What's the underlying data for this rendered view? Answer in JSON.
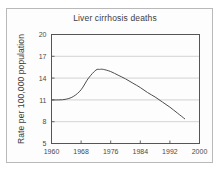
{
  "figure": {
    "title": "Liver cirrhosis deaths",
    "background_color": "#fdfdfd",
    "border_color": "#b9b9b9"
  },
  "chart_data": {
    "type": "line",
    "title": "Liver cirrhosis deaths",
    "xlabel": "",
    "ylabel": "Rate per 100,000 population",
    "xlim": [
      1960,
      2000
    ],
    "ylim": [
      5,
      20
    ],
    "xticks": [
      1960,
      1968,
      1976,
      1984,
      1992,
      2000
    ],
    "xticklabels": [
      "1960",
      "1968",
      "1976",
      "1984",
      "1992",
      "2000"
    ],
    "yticks": [
      5,
      8,
      11,
      14,
      17,
      20
    ],
    "yticklabels": [
      "5",
      "8",
      "11",
      "14",
      "17",
      "20"
    ],
    "grid": true,
    "grid_axis": "y",
    "legend": false,
    "line_color": "#4d4d4d",
    "line_width": 1,
    "series": [
      {
        "name": "Liver cirrhosis death rate",
        "x": [
          1960,
          1962,
          1964,
          1966,
          1968,
          1970,
          1972,
          1973,
          1974,
          1976,
          1978,
          1980,
          1982,
          1984,
          1986,
          1988,
          1990,
          1992,
          1994,
          1996
        ],
        "values": [
          11.0,
          11.0,
          11.1,
          11.5,
          12.4,
          14.0,
          15.1,
          15.2,
          15.2,
          14.9,
          14.4,
          13.9,
          13.3,
          12.7,
          12.0,
          11.4,
          10.7,
          10.0,
          9.2,
          8.4
        ]
      }
    ],
    "annotations": []
  },
  "axis": {
    "y_title": "Rate per 100,000 population"
  }
}
